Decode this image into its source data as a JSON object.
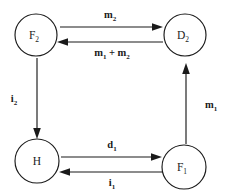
{
  "diagram": {
    "type": "cycle-graph",
    "background_color": "#ffffff",
    "stroke_color": "#1a1a1a",
    "nodes": [
      {
        "id": "F2",
        "base": "F",
        "sub": "2",
        "cx": 36,
        "cy": 35,
        "r": 21
      },
      {
        "id": "D2",
        "base": "D",
        "sub": "2",
        "cx": 185,
        "cy": 35,
        "r": 21
      },
      {
        "id": "H",
        "base": "H",
        "sub": "",
        "cx": 37,
        "cy": 161,
        "r": 22
      },
      {
        "id": "F1",
        "base": "F",
        "sub": "1",
        "cx": 184,
        "cy": 167,
        "r": 22
      }
    ],
    "edges": [
      {
        "id": "F2-to-D2",
        "from": "F2",
        "to": "D2",
        "direction": "right",
        "label_base": "m",
        "label_sub": "2",
        "label_full": "m2",
        "label_x": 110,
        "label_y": 16
      },
      {
        "id": "D2-to-F2",
        "from": "D2",
        "to": "F2",
        "direction": "left",
        "label_base": "m",
        "label_sub": "1",
        "label_extra": " + m",
        "label_extra_sub": "2",
        "label_full": "m1 + m2",
        "label_x": 112,
        "label_y": 54
      },
      {
        "id": "F2-to-H",
        "from": "F2",
        "to": "H",
        "direction": "down",
        "label_base": "i",
        "label_sub": "2",
        "label_full": "i2",
        "label_x": 14,
        "label_y": 100
      },
      {
        "id": "H-to-F1",
        "from": "H",
        "to": "F1",
        "direction": "right",
        "label_base": "d",
        "label_sub": "1",
        "label_full": "d1",
        "label_x": 112,
        "label_y": 146
      },
      {
        "id": "F1-to-H",
        "from": "F1",
        "to": "H",
        "direction": "left",
        "label_base": "i",
        "label_sub": "1",
        "label_full": "i1",
        "label_x": 112,
        "label_y": 184
      },
      {
        "id": "F1-to-D2",
        "from": "F1",
        "to": "D2",
        "direction": "up",
        "label_base": "m",
        "label_sub": "1",
        "label_full": "m1",
        "label_x": 211,
        "label_y": 106
      }
    ]
  }
}
